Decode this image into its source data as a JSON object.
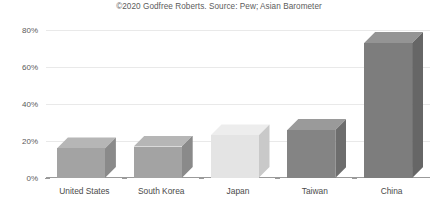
{
  "chart_data": {
    "type": "bar",
    "title": "©2020 Godfree Roberts. Source: Pew; Asian Barometer",
    "xlabel": "",
    "ylabel": "",
    "categories": [
      "United States",
      "South Korea",
      "Japan",
      "Taiwan",
      "China"
    ],
    "values": [
      16,
      17,
      23,
      26,
      73
    ],
    "value_suffix": "%",
    "ylim": [
      0,
      80
    ],
    "ytick_labels": [
      "0%",
      "20%",
      "40%",
      "60%",
      "80%"
    ],
    "ytick_values": [
      0,
      20,
      40,
      60,
      80
    ],
    "grid": true,
    "legend": "none",
    "style": "3d-bar",
    "bar_colors": [
      "#a3a3a3",
      "#a3a3a3",
      "#e4e4e4",
      "#848484",
      "#7d7d7d"
    ],
    "bar_top_colors": [
      "#b6b6b6",
      "#b6b6b6",
      "#ededed",
      "#9a9a9a",
      "#949494"
    ],
    "bar_side_colors": [
      "#8a8a8a",
      "#8a8a8a",
      "#c9c9c9",
      "#6d6d6d",
      "#666666"
    ]
  }
}
